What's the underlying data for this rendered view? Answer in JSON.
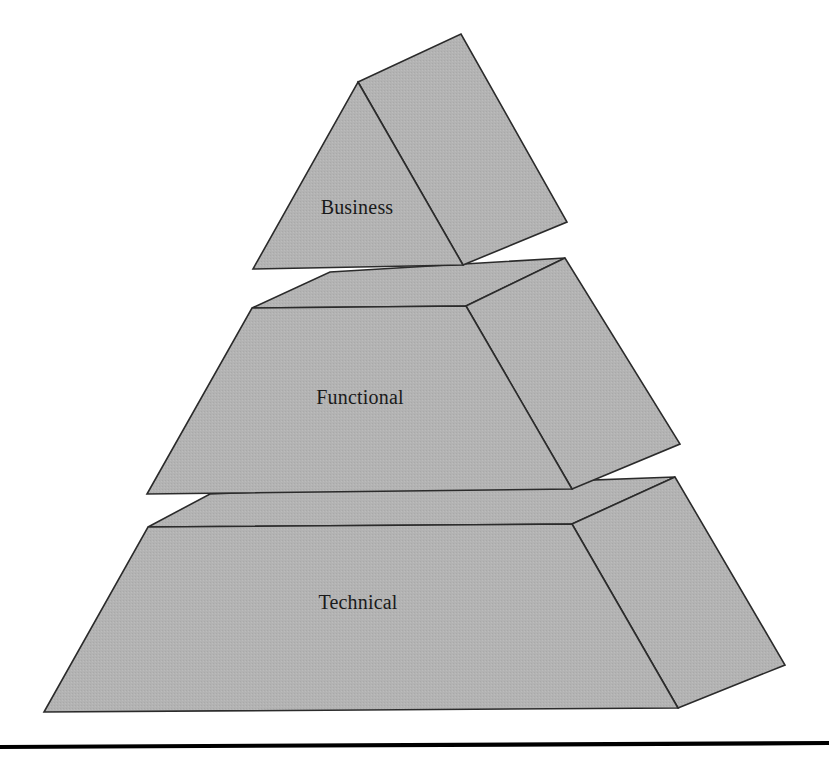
{
  "figure": {
    "type": "pyramid-diagram",
    "title": "",
    "orientation": "3d-isometric-right",
    "background_color": "#ffffff",
    "face_fill_color": "#b3b3b3",
    "face_stroke_color": "#2b2b2b",
    "label_color": "#1a1a1a",
    "baseline_color": "#000000",
    "tier_count": 3
  },
  "tiers": [
    {
      "id": "tier-top",
      "label": "Business",
      "level": 1,
      "position": "top",
      "label_x": 357,
      "label_y": 209,
      "front_face_points": "358,82 463,265 253,269",
      "side_face_points": "358,82 461,34 567,222 463,265"
    },
    {
      "id": "tier-middle",
      "label": "Functional",
      "level": 2,
      "position": "middle",
      "label_x": 360,
      "label_y": 399,
      "front_face_points": "252,308 466,306 572,489 147,494",
      "top_face_points": "252,308 330,272 565,258 466,306",
      "side_face_points": "466,306 565,258 680,444 572,489"
    },
    {
      "id": "tier-bottom",
      "label": "Technical",
      "level": 3,
      "position": "bottom",
      "label_x": 358,
      "label_y": 604,
      "front_face_points": "148,527 572,524 678,708 44,712",
      "top_face_points": "148,527 210,494 675,477 572,524",
      "side_face_points": "572,524 675,477 785,665 678,708"
    }
  ],
  "baseline": {
    "name": "page-divider-rule",
    "x1": 0,
    "y1": 747,
    "x2": 829,
    "y2": 743
  }
}
